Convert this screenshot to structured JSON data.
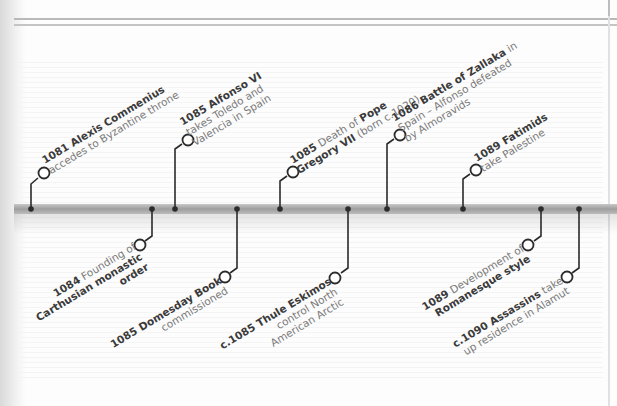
{
  "timeline": {
    "colors": {
      "bar": "#a8a8a8",
      "connector": "#2b2b2b",
      "text_bold": "#3a3a3a",
      "text_regular": "#7a7a7a"
    },
    "events_above": [
      {
        "year": "1081",
        "lines": [
          {
            "bold": "1081 Alexis Commenius",
            "rest": ""
          },
          {
            "bold": "",
            "rest": "accedes to Byzantine throne"
          }
        ]
      },
      {
        "year": "1085",
        "lines": [
          {
            "bold": "1085 Alfonso VI",
            "rest": ""
          },
          {
            "bold": "",
            "rest": "takes Toledo and"
          },
          {
            "bold": "",
            "rest": "Valencia in Spain"
          }
        ]
      },
      {
        "year": "1085",
        "lines": [
          {
            "bold": "1085",
            "rest": " Death of ",
            "bold2": "Pope"
          },
          {
            "bold": "Gregory VII",
            "rest": " (born c.1020)"
          }
        ]
      },
      {
        "year": "1086",
        "lines": [
          {
            "bold": "1086 Battle of Zallaka",
            "rest": " in"
          },
          {
            "bold": "",
            "rest": "Spain – Alfonso defeated"
          },
          {
            "bold": "",
            "rest": "by Almoravids"
          }
        ]
      },
      {
        "year": "1089",
        "lines": [
          {
            "bold": "1089 Fatimids",
            "rest": ""
          },
          {
            "bold": "",
            "rest": "take Palestine"
          }
        ]
      }
    ],
    "events_below": [
      {
        "year": "1084",
        "lines": [
          {
            "bold": "1084",
            "rest": " Founding of"
          },
          {
            "bold": "Carthusian monastic",
            "rest": ""
          },
          {
            "bold": "order",
            "rest": ""
          }
        ]
      },
      {
        "year": "1085",
        "lines": [
          {
            "bold": "1085 Domesday Book",
            "rest": ""
          },
          {
            "bold": "",
            "rest": "commissioned"
          }
        ]
      },
      {
        "year": "c.1085",
        "lines": [
          {
            "bold": "c.1085 Thule Eskimos",
            "rest": ""
          },
          {
            "bold": "",
            "rest": "control North"
          },
          {
            "bold": "",
            "rest": "American Arctic"
          }
        ]
      },
      {
        "year": "1089",
        "lines": [
          {
            "bold": "1089",
            "rest": " Development of"
          },
          {
            "bold": "Romanesque style",
            "rest": ""
          }
        ]
      },
      {
        "year": "c.1090",
        "lines": [
          {
            "bold": "c.1090 Assassins",
            "rest": " take"
          },
          {
            "bold": "",
            "rest": "up residence in Alamut"
          }
        ]
      }
    ]
  }
}
